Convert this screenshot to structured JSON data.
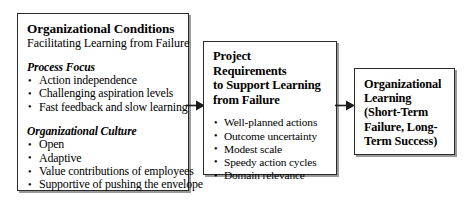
{
  "diagram": {
    "type": "flow-diagram",
    "colors": {
      "background": "#ffffff",
      "box_border": "#2a2a2a",
      "box_fill": "#ffffff",
      "shadow": "#9a9a9a",
      "text": "#000000"
    },
    "boxes": [
      {
        "id": "organizational-conditions",
        "title": "Organizational Conditions",
        "subtitle": "Facilitating Learning from Failure",
        "sections": [
          {
            "heading": "Process Focus",
            "items": [
              "Action independence",
              "Challenging aspiration levels",
              "Fast feedback and slow learning"
            ]
          },
          {
            "heading": "Organizational Culture",
            "items": [
              "Open",
              "Adaptive",
              "Value contributions of employees",
              "Supportive of pushing the envelope"
            ]
          }
        ]
      },
      {
        "id": "project-requirements",
        "title_lines": [
          "Project",
          "Requirements",
          "to Support Learning",
          "from Failure"
        ],
        "items": [
          "Well-planned actions",
          "Outcome uncertainty",
          "Modest scale",
          "Speedy action cycles",
          "Domain relevance"
        ]
      },
      {
        "id": "organizational-learning",
        "title_lines": [
          "Organizational",
          "Learning",
          "(Short-Term",
          "Failure, Long-",
          "Term Success)"
        ]
      }
    ],
    "arrows": [
      {
        "id": "arrow-conditions-to-requirements",
        "direction": "right"
      },
      {
        "id": "arrow-requirements-to-learning",
        "direction": "right"
      }
    ]
  }
}
